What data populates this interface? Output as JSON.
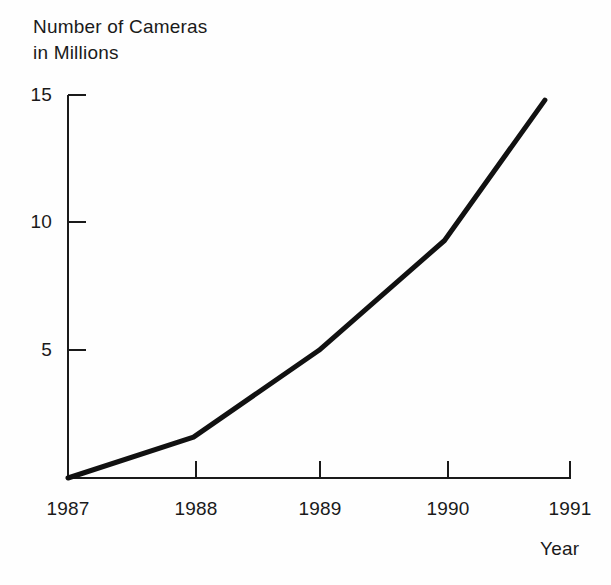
{
  "chart_data": {
    "type": "line",
    "title": "Number of Cameras\nin Millions",
    "title_line1": "Number of Cameras",
    "title_line2": "in Millions",
    "xlabel": "Year",
    "ylabel": "Number of Cameras in Millions",
    "x": [
      1987,
      1988,
      1989,
      1990,
      1990.8
    ],
    "values": [
      0,
      1.6,
      5.0,
      9.3,
      14.8
    ],
    "series": [
      {
        "name": "Number of Cameras in Millions",
        "values": [
          0,
          1.6,
          5.0,
          9.3,
          14.8
        ],
        "color": "#111111"
      }
    ],
    "xlim": [
      1987,
      1991
    ],
    "ylim": [
      0,
      15
    ],
    "xticks": [
      1987,
      1988,
      1989,
      1990,
      1991
    ],
    "xtick_labels": [
      "1987",
      "1988",
      "1989",
      "1990",
      "1991"
    ],
    "yticks": [
      5,
      10,
      15
    ],
    "ytick_labels": [
      "5",
      "10",
      "15"
    ],
    "grid": false,
    "legend": false,
    "legend_position": "none",
    "line_width": 5,
    "axis_color": "#1a1a1a",
    "background_color": "#fefefe"
  },
  "axes": {
    "y_axis_name": "vertical-value-axis",
    "x_axis_name": "horizontal-year-axis"
  }
}
